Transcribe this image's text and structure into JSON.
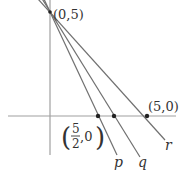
{
  "diagram": {
    "type": "coordinate-plane-lines",
    "colors": {
      "axis": "#999999",
      "line": "#707070",
      "point": "#222222",
      "text": "#333333"
    },
    "points": {
      "y_intercept": {
        "label": "(0,5)",
        "coords": [
          0,
          5
        ]
      },
      "p_x_intercept": {
        "label_num": "5",
        "label_den": "2",
        "label_rest": ",0",
        "coords": [
          2.5,
          0
        ]
      },
      "r_x_intercept": {
        "label": "(5,0)",
        "coords": [
          5,
          0
        ]
      }
    },
    "lines": [
      {
        "name": "p",
        "label": "p",
        "through": [
          [
            0,
            5
          ],
          [
            2.5,
            0
          ]
        ]
      },
      {
        "name": "q",
        "label": "q",
        "through": [
          [
            0,
            5
          ],
          [
            3.33,
            0
          ]
        ]
      },
      {
        "name": "r",
        "label": "r",
        "through": [
          [
            0,
            5
          ],
          [
            5,
            0
          ]
        ]
      }
    ],
    "paren_open": "(",
    "paren_close": ")"
  }
}
